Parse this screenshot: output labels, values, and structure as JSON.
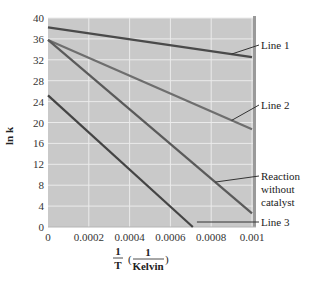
{
  "chart_data": {
    "type": "line",
    "title": "",
    "xlabel": "1/T (1/Kelvin)",
    "ylabel": "ln k",
    "xlim": [
      0,
      0.001
    ],
    "ylim": [
      0,
      40
    ],
    "grid": true,
    "legend_position": "right (leader-line annotations)",
    "x_ticks": [
      "0",
      "0.0002",
      "0.0004",
      "0.0006",
      "0.0008",
      "0.001"
    ],
    "y_ticks": [
      "0",
      "4",
      "8",
      "12",
      "16",
      "20",
      "24",
      "28",
      "32",
      "36",
      "40"
    ],
    "series": [
      {
        "name": "Line 1",
        "x": [
          0,
          0.001
        ],
        "values": [
          38.2,
          32.5
        ]
      },
      {
        "name": "Line 2",
        "x": [
          0,
          0.001
        ],
        "values": [
          35.8,
          18.7
        ]
      },
      {
        "name": "Reaction without catalyst",
        "x": [
          0,
          0.001
        ],
        "values": [
          35.8,
          2.6
        ]
      },
      {
        "name": "Line 3",
        "x": [
          0,
          0.00071
        ],
        "values": [
          25.2,
          0
        ]
      }
    ],
    "colors": {
      "plot_bg": "#c9c9c9",
      "grid": "#ebebeb",
      "line1": "#4a4a4a",
      "line2": "#6e6e6e",
      "reaction": "#5a5a5a",
      "line3": "#444444",
      "frame_right": "#9a9a9a"
    }
  },
  "labels": {
    "line1": "Line 1",
    "line2": "Line 2",
    "reaction_1": "Reaction",
    "reaction_2": "without",
    "reaction_3": "catalyst",
    "line3": "Line 3",
    "ylabel": "ln k",
    "x_num": "1",
    "x_den": "T",
    "x_unit_num": "1",
    "x_unit_den": "Kelvin"
  }
}
